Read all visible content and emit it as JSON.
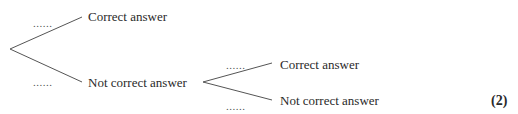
{
  "diagram": {
    "type": "tree-diagram",
    "stage1": {
      "branch_top": {
        "probability": "......",
        "label": "Correct answer"
      },
      "branch_bottom": {
        "probability": "......",
        "label": "Not correct answer"
      }
    },
    "stage2": {
      "parent": "Not correct answer",
      "branch_top": {
        "probability": "......",
        "label": "Correct answer"
      },
      "branch_bottom": {
        "probability": "......",
        "label": "Not correct answer"
      }
    },
    "marks": "(2)"
  }
}
